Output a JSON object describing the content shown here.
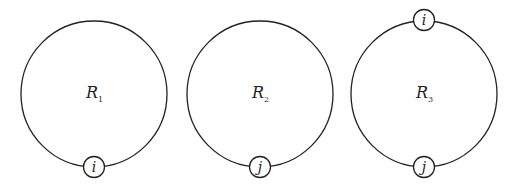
{
  "diagram": {
    "stroke_color": "#222222",
    "loops": [
      {
        "id": "loop-1",
        "region_label": "R",
        "region_subscript": "1",
        "nodes": [
          "i"
        ]
      },
      {
        "id": "loop-2",
        "region_label": "R",
        "region_subscript": "2",
        "nodes": [
          "j"
        ]
      },
      {
        "id": "loop-3",
        "region_label": "R",
        "region_subscript": "3",
        "nodes": [
          "i",
          "j"
        ]
      }
    ]
  }
}
